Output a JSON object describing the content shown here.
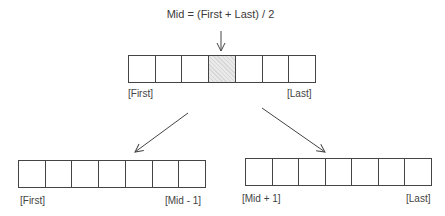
{
  "formula": "Mid = (First + Last) / 2",
  "top_array": {
    "cells": 7,
    "highlighted_index": 3,
    "left_label": "[First]",
    "right_label": "[Last]"
  },
  "bottom_left_array": {
    "cells": 7,
    "left_label": "[First]",
    "right_label": "[Mid - 1]"
  },
  "bottom_right_array": {
    "cells": 7,
    "left_label": "[Mid + 1]",
    "right_label": "[Last]"
  },
  "colors": {
    "line": "#444444",
    "highlight": "#e9e9e9"
  }
}
